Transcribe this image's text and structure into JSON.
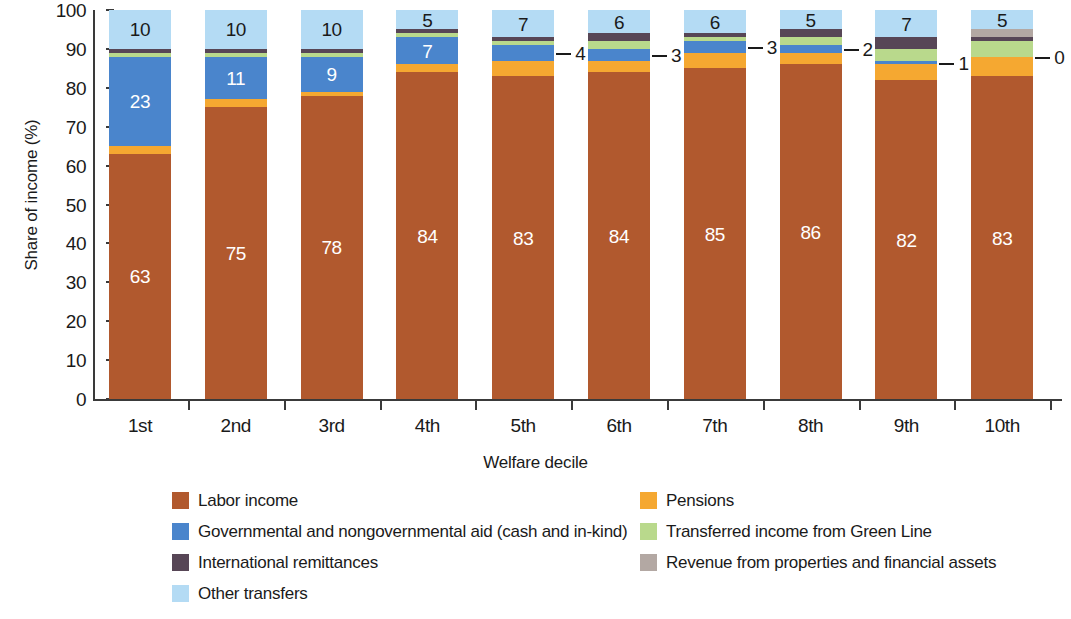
{
  "chart_data": {
    "type": "bar",
    "subtype": "stacked-bar-100-percent",
    "title": "",
    "xlabel": "Welfare decile",
    "ylabel": "Share of income (%)",
    "ylim": [
      0,
      100
    ],
    "yticks": [
      0,
      10,
      20,
      30,
      40,
      50,
      60,
      70,
      80,
      90,
      100
    ],
    "grid": false,
    "legend_position": "bottom",
    "categories": [
      "1st",
      "2nd",
      "3rd",
      "4th",
      "5th",
      "6th",
      "7th",
      "8th",
      "9th",
      "10th"
    ],
    "series": [
      {
        "name": "Labor income",
        "color": "#b1592e",
        "values": [
          63,
          75,
          78,
          84,
          83,
          84,
          85,
          86,
          82,
          83
        ]
      },
      {
        "name": "Pensions",
        "color": "#f5a831",
        "values": [
          2,
          2,
          1,
          2,
          4,
          3,
          4,
          3,
          4,
          5
        ]
      },
      {
        "name": "Governmental and nongovernmental aid (cash and in-kind)",
        "color": "#4a85cc",
        "values": [
          23,
          11,
          9,
          7,
          4,
          3,
          3,
          2,
          1,
          0
        ]
      },
      {
        "name": "Transferred income from Green Line",
        "color": "#b9d98c",
        "values": [
          1,
          1,
          1,
          1,
          1,
          2,
          1,
          2,
          3,
          4
        ]
      },
      {
        "name": "International remittances",
        "color": "#574656",
        "values": [
          1,
          1,
          1,
          1,
          1,
          2,
          1,
          2,
          3,
          1
        ]
      },
      {
        "name": "Revenue from properties and financial assets",
        "color": "#b3a8a3",
        "values": [
          0,
          0,
          0,
          0,
          0,
          0,
          0,
          0,
          0,
          2
        ]
      },
      {
        "name": "Other transfers",
        "color": "#b4dbf4",
        "values": [
          10,
          10,
          10,
          5,
          7,
          6,
          6,
          5,
          7,
          5
        ]
      }
    ],
    "labels_in_bars": [
      {
        "category": "1st",
        "series": "Labor income",
        "value": "63",
        "style": "light"
      },
      {
        "category": "2nd",
        "series": "Labor income",
        "value": "75",
        "style": "light"
      },
      {
        "category": "3rd",
        "series": "Labor income",
        "value": "78",
        "style": "light"
      },
      {
        "category": "4th",
        "series": "Labor income",
        "value": "84",
        "style": "light"
      },
      {
        "category": "5th",
        "series": "Labor income",
        "value": "83",
        "style": "light"
      },
      {
        "category": "6th",
        "series": "Labor income",
        "value": "84",
        "style": "light"
      },
      {
        "category": "7th",
        "series": "Labor income",
        "value": "85",
        "style": "light"
      },
      {
        "category": "8th",
        "series": "Labor income",
        "value": "86",
        "style": "light"
      },
      {
        "category": "9th",
        "series": "Labor income",
        "value": "82",
        "style": "light"
      },
      {
        "category": "10th",
        "series": "Labor income",
        "value": "83",
        "style": "light"
      },
      {
        "category": "1st",
        "series": "Governmental and nongovernmental aid (cash and in-kind)",
        "value": "23",
        "style": "light"
      },
      {
        "category": "2nd",
        "series": "Governmental and nongovernmental aid (cash and in-kind)",
        "value": "11",
        "style": "light"
      },
      {
        "category": "3rd",
        "series": "Governmental and nongovernmental aid (cash and in-kind)",
        "value": "9",
        "style": "light"
      },
      {
        "category": "4th",
        "series": "Governmental and nongovernmental aid (cash and in-kind)",
        "value": "7",
        "style": "light"
      },
      {
        "category": "1st",
        "series": "Other transfers",
        "value": "10",
        "style": "dark"
      },
      {
        "category": "2nd",
        "series": "Other transfers",
        "value": "10",
        "style": "dark"
      },
      {
        "category": "3rd",
        "series": "Other transfers",
        "value": "10",
        "style": "dark"
      },
      {
        "category": "4th",
        "series": "Other transfers",
        "value": "5",
        "style": "dark"
      },
      {
        "category": "5th",
        "series": "Other transfers",
        "value": "7",
        "style": "dark"
      },
      {
        "category": "6th",
        "series": "Other transfers",
        "value": "6",
        "style": "dark"
      },
      {
        "category": "7th",
        "series": "Other transfers",
        "value": "6",
        "style": "dark"
      },
      {
        "category": "8th",
        "series": "Other transfers",
        "value": "5",
        "style": "dark"
      },
      {
        "category": "9th",
        "series": "Other transfers",
        "value": "7",
        "style": "dark"
      },
      {
        "category": "10th",
        "series": "Other transfers",
        "value": "5",
        "style": "dark"
      }
    ],
    "callouts": [
      {
        "category": "5th",
        "series": "Governmental and nongovernmental aid (cash and in-kind)",
        "value": "4"
      },
      {
        "category": "6th",
        "series": "Governmental and nongovernmental aid (cash and in-kind)",
        "value": "3"
      },
      {
        "category": "7th",
        "series": "Governmental and nongovernmental aid (cash and in-kind)",
        "value": "3"
      },
      {
        "category": "8th",
        "series": "Governmental and nongovernmental aid (cash and in-kind)",
        "value": "2"
      },
      {
        "category": "9th",
        "series": "Governmental and nongovernmental aid (cash and in-kind)",
        "value": "1"
      },
      {
        "category": "10th",
        "series": "Governmental and nongovernmental aid (cash and in-kind)",
        "value": "0"
      }
    ]
  },
  "legend": {
    "column_left": [
      {
        "label": "Labor income",
        "color": "#b1592e"
      },
      {
        "label": "Governmental and nongovernmental aid (cash and in-kind)",
        "color": "#4a85cc"
      },
      {
        "label": "International remittances",
        "color": "#574656"
      },
      {
        "label": "Other transfers",
        "color": "#b4dbf4"
      }
    ],
    "column_right": [
      {
        "label": "Pensions",
        "color": "#f5a831"
      },
      {
        "label": "Transferred income from Green Line",
        "color": "#b9d98c"
      },
      {
        "label": "Revenue from properties and financial assets",
        "color": "#b3a8a3"
      }
    ]
  },
  "axes": {
    "y_title": "Share of income (%)",
    "x_title": "Welfare decile",
    "y_tick_labels": [
      "100",
      "90",
      "80",
      "70",
      "60",
      "50",
      "40",
      "30",
      "20",
      "10",
      "0"
    ],
    "x_tick_labels": [
      "1st",
      "2nd",
      "3rd",
      "4th",
      "5th",
      "6th",
      "7th",
      "8th",
      "9th",
      "10th"
    ]
  }
}
